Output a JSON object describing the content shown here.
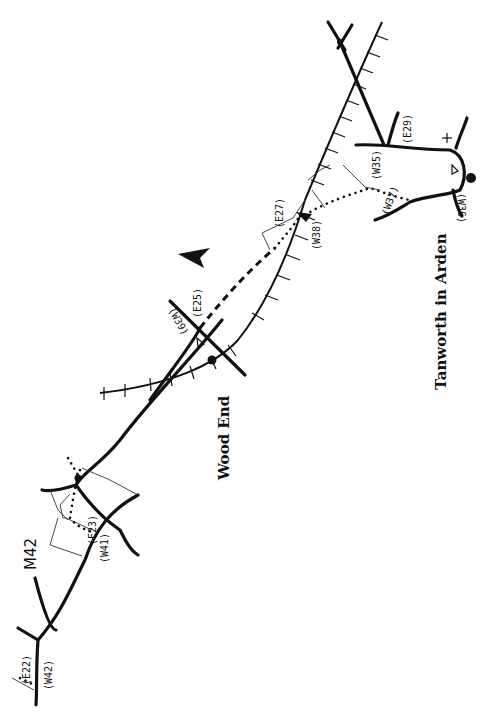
{
  "map": {
    "places": {
      "wood_end": "Wood End",
      "tanworth": "Tanworth in Arden"
    },
    "roads": {
      "motorway": "M42"
    },
    "waypoints": {
      "w35": "(W35)",
      "e29": "(E29)",
      "w36": "(W36)",
      "w37": "(W37)",
      "w38": "(W38)",
      "e27": "(E27)",
      "e25": "(E25)",
      "w39": "(W39)",
      "e23": "(E23)",
      "w41": "(W41)",
      "e22": "(E22)",
      "w42": "(W42)"
    },
    "symbols": {
      "north_arrow": "north-arrow",
      "church": "cross",
      "pub": "triangle",
      "station": "dot"
    },
    "colors": {
      "ink": "#111111",
      "paper": "#ffffff"
    }
  }
}
